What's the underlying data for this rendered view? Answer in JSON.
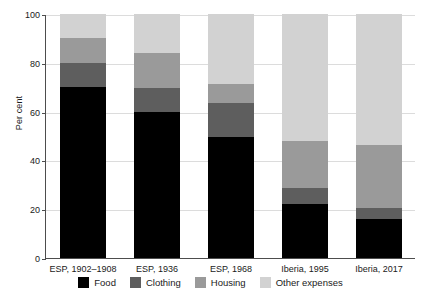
{
  "chart_data": {
    "type": "bar",
    "subtype": "stacked-bar-100",
    "title": "",
    "xlabel": "",
    "ylabel": "Per cent",
    "ylim": [
      0,
      100
    ],
    "yticks": [
      0,
      20,
      40,
      60,
      80,
      100
    ],
    "ytick_labels": [
      "0",
      "20",
      "40",
      "60",
      "80",
      "100"
    ],
    "grid": true,
    "legend_position": "bottom",
    "categories": [
      "ESP, 1902–1908",
      "ESP, 1936",
      "ESP, 1968",
      "Iberia, 1995",
      "Iberia, 2017"
    ],
    "series": [
      {
        "name": "Food",
        "color": "#000000",
        "values": [
          70.0,
          60.0,
          49.5,
          22.0,
          16.0
        ]
      },
      {
        "name": "Clothing",
        "color": "#5e5e5e",
        "values": [
          10.0,
          9.5,
          14.0,
          6.5,
          4.5
        ]
      },
      {
        "name": "Housing",
        "color": "#9a9a9a",
        "values": [
          10.0,
          14.5,
          8.0,
          19.5,
          26.0
        ]
      },
      {
        "name": "Other expenses",
        "color": "#d2d2d2",
        "values": [
          10.0,
          16.0,
          28.5,
          52.0,
          53.5
        ]
      }
    ]
  },
  "axis": {
    "line_color": "#4d4d4d",
    "grid_color": "#dcdcdc"
  }
}
